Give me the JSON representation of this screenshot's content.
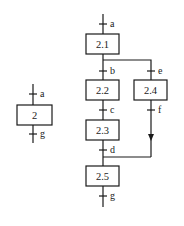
{
  "diagram": {
    "type": "grafcet-macro-step-expansion",
    "left": {
      "step": "2",
      "transition_in": "a",
      "transition_out": "g"
    },
    "right": {
      "steps": [
        "2.1",
        "2.2",
        "2.3",
        "2.4",
        "2.5"
      ],
      "transitions": {
        "t_in": "a",
        "t_b": "b",
        "t_e": "e",
        "t_c": "c",
        "t_f": "f",
        "t_d": "d",
        "t_out": "g"
      }
    },
    "colors": {
      "stroke": "#1a1a1a",
      "background": "#ffffff"
    }
  }
}
